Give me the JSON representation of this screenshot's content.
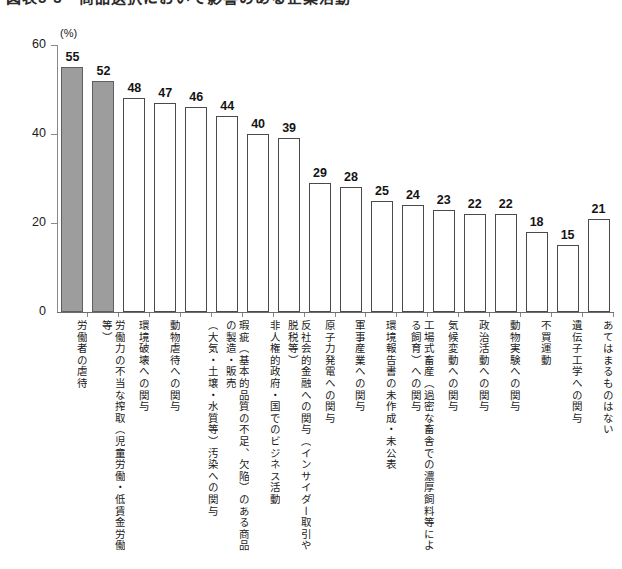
{
  "title": {
    "text": "図表5-3　商品選択において影響のある企業活動",
    "cropped": true
  },
  "chart_data": {
    "type": "bar",
    "title": "図表5-3　商品選択において影響のある企業活動",
    "xlabel": "",
    "ylabel": "",
    "unit_label": "(%)",
    "ylim": [
      0,
      60
    ],
    "yticks": [
      0,
      20,
      40,
      60
    ],
    "ytick_labels": [
      "0",
      "20",
      "40",
      "60"
    ],
    "grid": false,
    "legend": "none",
    "highlight_color": "#9d9d9d",
    "bar_outline_color": "#4a4a4a",
    "axis_color": "#8a8a8a",
    "categories": [
      "労働者の虐待",
      "労働力の不当な搾取（児童労働・低賃金労働等）",
      "環境破壊への関与",
      "動物虐待への関与",
      "（大気・土壌・水質等）汚染への関与",
      "瑕疵（基本的品質の不足、欠陥）のある商品の製造・販売",
      "非人権的政府・国でのビジネス活動",
      "反社会的金融への関与（インサイダー取引や脱税等）",
      "原子力発電への関与",
      "軍事産業への関与",
      "環境報告書の未作成・未公表",
      "工場式畜産（過密な畜舎での濃厚飼料等による飼育）への関与",
      "気候変動への関与",
      "政治活動への関与",
      "動物実験への関与",
      "不買運動",
      "遺伝子工学への関与",
      "あてはまるものはない"
    ],
    "values": [
      55,
      52,
      48,
      47,
      46,
      44,
      40,
      39,
      29,
      28,
      25,
      24,
      23,
      22,
      22,
      18,
      15,
      21
    ],
    "highlighted": [
      true,
      true,
      false,
      false,
      false,
      false,
      false,
      false,
      false,
      false,
      false,
      false,
      false,
      false,
      false,
      false,
      false,
      false
    ]
  }
}
